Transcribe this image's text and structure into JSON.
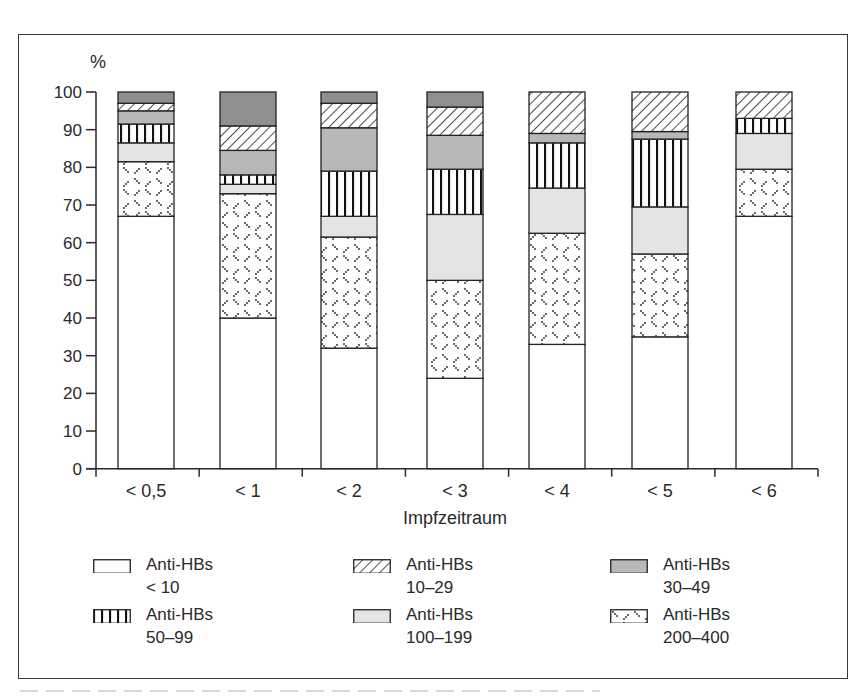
{
  "chart_data": {
    "type": "bar",
    "stacked": true,
    "title": "",
    "xlabel": "Impfzeitraum",
    "ylabel": "%",
    "ylim": [
      0,
      100
    ],
    "yticks": [
      0,
      10,
      20,
      30,
      40,
      50,
      60,
      70,
      80,
      90,
      100
    ],
    "grid": false,
    "legend_position": "bottom",
    "categories": [
      "< 0,5",
      "< 1",
      "< 2",
      "< 3",
      "< 4",
      "< 5",
      "< 6"
    ],
    "series": [
      {
        "name": "Anti-HBs < 10",
        "key": "lt10",
        "pattern": "blank",
        "values": [
          67,
          40,
          32,
          24,
          33,
          35,
          67
        ]
      },
      {
        "name": "Anti-HBs 200–400",
        "key": "r200",
        "pattern": "dots",
        "values": [
          14.5,
          33,
          29.5,
          26,
          29.5,
          22,
          12.5
        ]
      },
      {
        "name": "Anti-HBs 100–199",
        "key": "r100",
        "pattern": "lightgray",
        "values": [
          5,
          2.5,
          5.5,
          17.5,
          12,
          12.5,
          9.5
        ]
      },
      {
        "name": "Anti-HBs 50–99",
        "key": "r50",
        "pattern": "vlines",
        "values": [
          5,
          2.5,
          12,
          12,
          12,
          18,
          4
        ]
      },
      {
        "name": "Anti-HBs 30–49",
        "key": "r30",
        "pattern": "midgray",
        "values": [
          3.5,
          6.5,
          11.5,
          9,
          2.5,
          2,
          0
        ]
      },
      {
        "name": "Anti-HBs 10–29",
        "key": "r10",
        "pattern": "hatch",
        "values": [
          2,
          6.5,
          6.5,
          7.5,
          11,
          10.5,
          7
        ]
      },
      {
        "name": "(unlabeled, dark gray)",
        "key": "dark",
        "pattern": "darkgray",
        "values": [
          3,
          9,
          3,
          4,
          0,
          0,
          0
        ]
      }
    ]
  },
  "legend": [
    {
      "line1": "Anti-HBs",
      "line2": "< 10",
      "pattern": "blank"
    },
    {
      "line1": "Anti-HBs",
      "line2": "10–29",
      "pattern": "hatch"
    },
    {
      "line1": "Anti-HBs",
      "line2": "30–49",
      "pattern": "midgray"
    },
    {
      "line1": "Anti-HBs",
      "line2": "50–99",
      "pattern": "vlines"
    },
    {
      "line1": "Anti-HBs",
      "line2": "100–199",
      "pattern": "lightgray"
    },
    {
      "line1": "Anti-HBs",
      "line2": "200–400",
      "pattern": "dots"
    }
  ],
  "colors": {
    "axis": "#2a2a2a",
    "lightgray": "#e4e4e4",
    "midgray": "#b8b8b8",
    "darkgray": "#8f8f8f",
    "blank": "#ffffff"
  }
}
